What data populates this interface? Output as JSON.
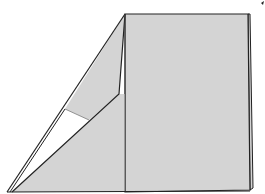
{
  "diagram": {
    "type": "origami-fold-step",
    "colors": {
      "paper": "#d4d4d4",
      "line": "#222222",
      "background": "#ffffff",
      "gap": "#ffffff"
    },
    "marks": {
      "corner_tick": "small arrow tick at top-right corner"
    }
  }
}
